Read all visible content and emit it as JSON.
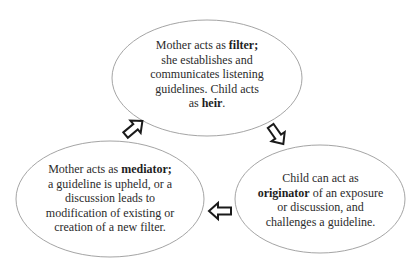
{
  "diagram": {
    "type": "cycle",
    "colors": {
      "ellipse_stroke": "#9a9a9a",
      "arrow_stroke": "#1a1a1a",
      "arrow_fill": "#ffffff",
      "text": "#2b2b2b"
    },
    "nodes": [
      {
        "id": "filter",
        "position": "top",
        "segments": [
          {
            "text": "Mother acts as ",
            "bold": false
          },
          {
            "text": "filter;",
            "bold": true
          },
          {
            "text": " she establishes and communicates listening guidelines. Child acts as ",
            "bold": false
          },
          {
            "text": "heir",
            "bold": true
          },
          {
            "text": ".",
            "bold": false
          }
        ],
        "lines": [
          "Mother acts as filter;",
          "she establishes and",
          "communicates listening",
          "guidelines. Child acts",
          "as heir."
        ]
      },
      {
        "id": "originator",
        "position": "bottom-right",
        "segments": [
          {
            "text": "Child can act as ",
            "bold": false
          },
          {
            "text": "originator",
            "bold": true
          },
          {
            "text": " of an exposure or discussion, and challenges a guideline.",
            "bold": false
          }
        ],
        "lines": [
          "Child can act as",
          "originator of an exposure",
          "or discussion, and",
          "challenges a guideline."
        ]
      },
      {
        "id": "mediator",
        "position": "bottom-left",
        "segments": [
          {
            "text": "Mother acts as ",
            "bold": false
          },
          {
            "text": "mediator;",
            "bold": true
          },
          {
            "text": " a guideline is upheld, or a discussion leads to modification of existing or creation of a new filter.",
            "bold": false
          }
        ],
        "lines": [
          "Mother acts as mediator;",
          "a guideline is upheld, or a",
          "discussion leads to",
          "modification of existing or",
          "creation of a new filter."
        ]
      }
    ],
    "edges": [
      {
        "from": "filter",
        "to": "originator",
        "arrow": "hollow-block-arrow-down-right"
      },
      {
        "from": "originator",
        "to": "mediator",
        "arrow": "hollow-block-arrow-left"
      },
      {
        "from": "mediator",
        "to": "filter",
        "arrow": "hollow-block-arrow-up-right"
      }
    ]
  },
  "text": {
    "top": {
      "l1a": "Mother acts as ",
      "l1b": "filter;",
      "l2": "she establishes and",
      "l3": "communicates listening",
      "l4": "guidelines. Child acts",
      "l5a": "as ",
      "l5b": "heir",
      "l5c": "."
    },
    "right": {
      "l1": "Child can act as",
      "l2a": "originator",
      "l2b": " of an exposure",
      "l3": "or discussion, and",
      "l4": "challenges a guideline."
    },
    "left": {
      "l1a": "Mother acts as ",
      "l1b": "mediator;",
      "l2": "a guideline is upheld, or a",
      "l3": "discussion leads to",
      "l4": "modification of existing or",
      "l5": "creation of a new filter."
    }
  }
}
